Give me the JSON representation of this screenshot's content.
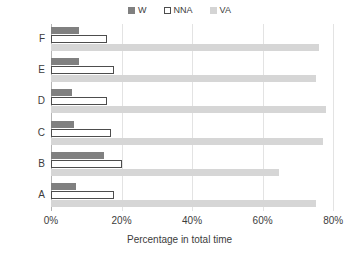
{
  "chart_data": {
    "type": "bar",
    "orientation": "horizontal",
    "title": "",
    "xlabel": "Percentage in total time",
    "ylabel": "System",
    "categories": [
      "A",
      "B",
      "C",
      "D",
      "E",
      "F"
    ],
    "category_order_top_to_bottom": [
      "F",
      "E",
      "D",
      "C",
      "B",
      "A"
    ],
    "series": [
      {
        "name": "W",
        "values": [
          7,
          15,
          6.5,
          6,
          8,
          8
        ],
        "color": "#808080",
        "style": "filled"
      },
      {
        "name": "NNA",
        "values": [
          18,
          20,
          17,
          16,
          18,
          16
        ],
        "color": "#ffffff",
        "style": "outlined"
      },
      {
        "name": "VA",
        "values": [
          75,
          64.5,
          77,
          78,
          75,
          76
        ],
        "color": "#d6d6d6",
        "style": "filled"
      }
    ],
    "xlim": [
      0,
      82.5
    ],
    "xticks": [
      0,
      20,
      40,
      60,
      80
    ],
    "xtick_labels": [
      "0%",
      "20%",
      "40%",
      "60%",
      "80%"
    ],
    "grid": "vertical",
    "legend_position": "top-center",
    "legend_entries": [
      "W",
      "NNA",
      "VA"
    ]
  },
  "legend": {
    "items": [
      {
        "label": "W",
        "swatch": "legend-swatch-w"
      },
      {
        "label": "NNA",
        "swatch": "legend-swatch-nna"
      },
      {
        "label": "VA",
        "swatch": "legend-swatch-va"
      }
    ]
  },
  "axes": {
    "y_title": "System",
    "x_title": "Percentage in total time",
    "y_ticks": [
      "F",
      "E",
      "D",
      "C",
      "B",
      "A"
    ],
    "x_ticks": [
      "0%",
      "20%",
      "40%",
      "60%",
      "80%"
    ]
  }
}
